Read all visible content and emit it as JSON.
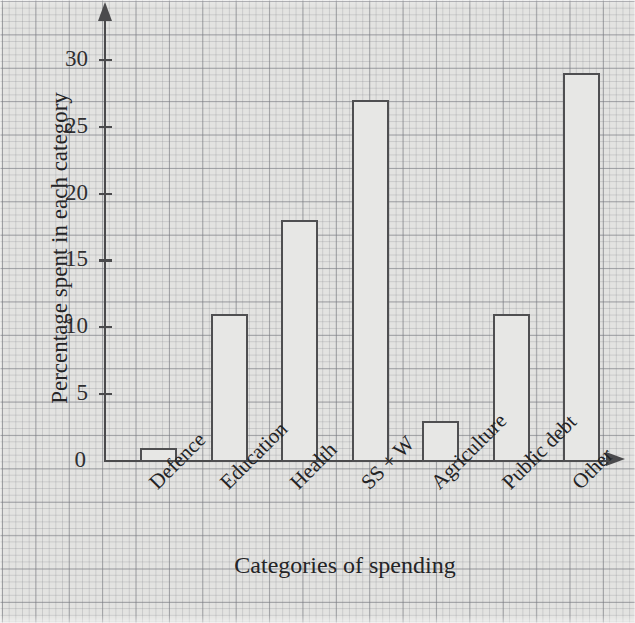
{
  "chart_data": {
    "type": "bar",
    "title": "",
    "xlabel": "Categories of spending",
    "ylabel": "Percentage spent in each category",
    "categories": [
      "Defence",
      "Education",
      "Health",
      "SS + W",
      "Agriculture",
      "Public debt",
      "Other"
    ],
    "values": [
      1,
      11,
      18,
      27,
      3,
      11,
      29
    ],
    "ylim": [
      0,
      32
    ],
    "yticks": [
      0,
      5,
      10,
      15,
      20,
      25,
      30
    ],
    "ytick_labels": [
      "0",
      "5",
      "10",
      "15",
      "20",
      "25",
      "30"
    ],
    "grid": true,
    "legend": false,
    "background": "graph-paper",
    "bar_fill": "#e7e7e5",
    "bar_edge": "#4f4f51",
    "axis_color": "#4a4a4c",
    "label_rotation_deg": -45
  }
}
